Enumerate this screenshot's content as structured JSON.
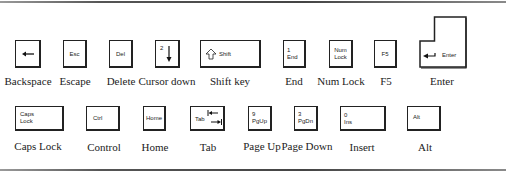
{
  "row1": {
    "keys": [
      {
        "id": "backspace",
        "cap": "",
        "icon": "left-arrow-icon",
        "label": "Backspace"
      },
      {
        "id": "escape",
        "cap": "Esc",
        "label": "Escape"
      },
      {
        "id": "delete",
        "cap": "Del",
        "label": "Delete"
      },
      {
        "id": "cursor-down",
        "cap": "2",
        "icon": "down-arrow-icon",
        "label": "Cursor down"
      },
      {
        "id": "shift",
        "cap": "Shift",
        "icon": "shift-arrow-icon",
        "label": "Shift key"
      },
      {
        "id": "end",
        "cap": "1\nEnd",
        "label": "End"
      },
      {
        "id": "num-lock",
        "cap": "Num\nLock",
        "label": "Num Lock"
      },
      {
        "id": "f5",
        "cap": "F5",
        "label": "F5"
      },
      {
        "id": "enter",
        "cap": "Enter",
        "icon": "return-arrow-icon",
        "label": "Enter"
      }
    ]
  },
  "row2": {
    "keys": [
      {
        "id": "caps-lock",
        "cap": "Caps\nLock",
        "label": "Caps Lock"
      },
      {
        "id": "control",
        "cap": "Ctrl",
        "label": "Control"
      },
      {
        "id": "home",
        "cap": "Home",
        "label": "Home"
      },
      {
        "id": "tab",
        "cap": "Tab",
        "icon": "tab-arrows-icon",
        "label": "Tab"
      },
      {
        "id": "page-up",
        "cap": "9\nPgUp",
        "label": "Page Up"
      },
      {
        "id": "page-down",
        "cap": "3\nPgDn",
        "label": "Page Down"
      },
      {
        "id": "insert",
        "cap": "0\nIns",
        "label": "Insert"
      },
      {
        "id": "alt",
        "cap": "Alt",
        "label": "Alt"
      }
    ]
  }
}
